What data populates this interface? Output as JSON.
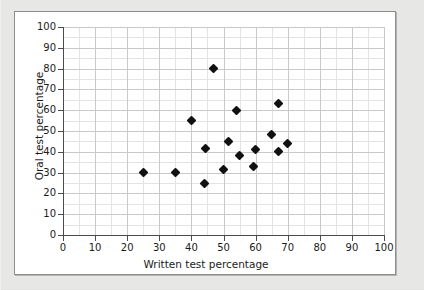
{
  "figure": {
    "background_color": "#ffffff",
    "border_color": "#8d8d8d",
    "page_background": "#e7e7e5",
    "marker_color": "#111111",
    "grid_color": "#c9c9c9",
    "axis_color": "#4b4b4b"
  },
  "chart_data": {
    "type": "scatter",
    "title": "",
    "xlabel": "Written test percentage",
    "ylabel": "Oral test percentage",
    "xlim": [
      0,
      100
    ],
    "ylim": [
      0,
      100
    ],
    "xticks": [
      0,
      10,
      20,
      30,
      40,
      50,
      60,
      70,
      80,
      90,
      100
    ],
    "yticks": [
      0,
      10,
      20,
      30,
      40,
      50,
      60,
      70,
      80,
      90,
      100
    ],
    "xtick_labels": [
      "0",
      "10",
      "20",
      "30",
      "40",
      "50",
      "60",
      "70",
      "80",
      "90",
      "100"
    ],
    "ytick_labels": [
      "0",
      "10",
      "20",
      "30",
      "40",
      "50",
      "60",
      "70",
      "80",
      "90",
      "100"
    ],
    "grid": true,
    "minor_grid": true,
    "minor_grid_step": 5,
    "legend": null,
    "legend_position": "none",
    "marker": "diamond",
    "series": [
      {
        "name": "students",
        "points": [
          {
            "x": 25,
            "y": 30
          },
          {
            "x": 35,
            "y": 30
          },
          {
            "x": 40,
            "y": 55
          },
          {
            "x": 44,
            "y": 25
          },
          {
            "x": 44.5,
            "y": 41.5
          },
          {
            "x": 47,
            "y": 80
          },
          {
            "x": 50,
            "y": 31.5
          },
          {
            "x": 51.5,
            "y": 45
          },
          {
            "x": 54,
            "y": 60
          },
          {
            "x": 55,
            "y": 38
          },
          {
            "x": 59.5,
            "y": 33
          },
          {
            "x": 60,
            "y": 41
          },
          {
            "x": 65,
            "y": 48.5
          },
          {
            "x": 67,
            "y": 63
          },
          {
            "x": 67,
            "y": 40
          },
          {
            "x": 70,
            "y": 44
          }
        ]
      }
    ]
  }
}
